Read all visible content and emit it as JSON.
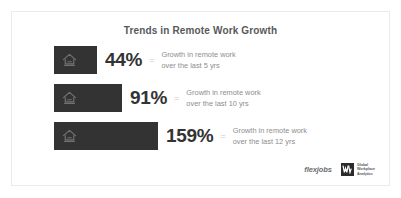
{
  "card": {
    "title": "Trends in Remote Work Growth",
    "border_color": "#ebebeb",
    "background_color": "#ffffff"
  },
  "icons": {
    "bar_icon_name": "home-icon",
    "gwa_mark_name": "gwa-monogram-icon"
  },
  "rows": [
    {
      "value_label": "44%",
      "equals_label": "=",
      "desc_line1": "Growth in remote work",
      "desc_line2": "over the last 5 yrs"
    },
    {
      "value_label": "91%",
      "equals_label": "=",
      "desc_line1": "Growth in remote work",
      "desc_line2": "over the last 10 yrs"
    },
    {
      "value_label": "159%",
      "equals_label": "=",
      "desc_line1": "Growth in remote work",
      "desc_line2": "over the last 12 yrs"
    }
  ],
  "footer": {
    "flexjobs_label": "flexjobs",
    "gwa_line1": "Global",
    "gwa_line2": "Workplace",
    "gwa_line3": "Analytics"
  },
  "chart_data": {
    "type": "bar",
    "title": "Trends in Remote Work Growth",
    "orientation": "horizontal",
    "categories": [
      "Growth in remote work over the last 5 yrs",
      "Growth in remote work over the last 10 yrs",
      "Growth in remote work over the last 12 yrs"
    ],
    "values": [
      44,
      91,
      159
    ],
    "value_labels": [
      "44%",
      "91%",
      "159%"
    ],
    "unit": "percent",
    "xlabel": "",
    "ylabel": "",
    "xlim": [
      0,
      159
    ],
    "grid": false,
    "legend": "none",
    "bar_color": "#333333",
    "label_color": "#333333",
    "description_color": "#8d8d8d",
    "annotations": [
      "flexjobs",
      "Global Workplace Analytics"
    ]
  }
}
